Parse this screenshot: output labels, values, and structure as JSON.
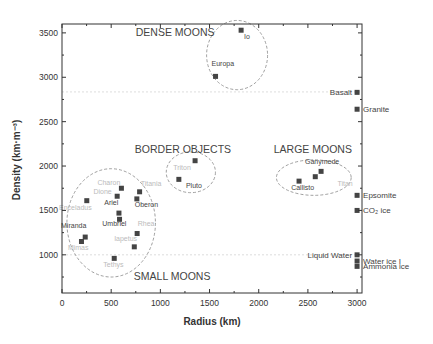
{
  "chart_data": {
    "type": "scatter",
    "title": "",
    "xlabel": "Radius (km)",
    "ylabel": "Density (km·m⁻³)",
    "xlim": [
      0,
      3050
    ],
    "ylim": [
      570,
      3600
    ],
    "xticks": [
      0,
      500,
      1000,
      1500,
      2000,
      2500,
      3000
    ],
    "yticks": [
      1000,
      1500,
      2000,
      2500,
      3000,
      3500
    ],
    "grid": false,
    "legend": null,
    "reference_lines": [
      2835,
      1000
    ],
    "groups": [
      {
        "name": "DENSE MOONS",
        "label_x": 1150,
        "label_y": 3470,
        "ellipse": {
          "cx": 1780,
          "cy": 3250,
          "rx": 310,
          "ry": 390
        }
      },
      {
        "name": "BORDER OBJECTS",
        "label_x": 1230,
        "label_y": 2150,
        "ellipse": {
          "cx": 1310,
          "cy": 1930,
          "rx": 250,
          "ry": 230
        }
      },
      {
        "name": "LARGE MOONS",
        "label_x": 2550,
        "label_y": 2150,
        "ellipse": {
          "cx": 2560,
          "cy": 1870,
          "rx": 380,
          "ry": 200
        }
      },
      {
        "name": "SMALL MOONS",
        "label_x": 1120,
        "label_y": 720,
        "ellipse": {
          "cx": 500,
          "cy": 1360,
          "rx": 450,
          "ry": 610
        }
      }
    ],
    "series": [
      {
        "name": "Moons",
        "points": [
          {
            "label": "Io",
            "x": 1821,
            "y": 3530,
            "faint": false,
            "lx": 1850,
            "ly": 3430
          },
          {
            "label": "Europa",
            "x": 1561,
            "y": 3010,
            "faint": false,
            "lx": 1520,
            "ly": 3130
          },
          {
            "label": "Triton",
            "x": 1353,
            "y": 2060,
            "faint": true,
            "lx": 1130,
            "ly": 1960
          },
          {
            "label": "Pluto",
            "x": 1188,
            "y": 1850,
            "faint": false,
            "lx": 1260,
            "ly": 1750
          },
          {
            "label": "Ganymede",
            "x": 2634,
            "y": 1940,
            "faint": false,
            "lx": 2470,
            "ly": 2020
          },
          {
            "label": "Titan",
            "x": 2575,
            "y": 1880,
            "faint": true,
            "lx": 2800,
            "ly": 1780
          },
          {
            "label": "Callisto",
            "x": 2410,
            "y": 1830,
            "faint": false,
            "lx": 2330,
            "ly": 1730
          },
          {
            "label": "Charon",
            "x": 604,
            "y": 1750,
            "faint": true,
            "lx": 360,
            "ly": 1790
          },
          {
            "label": "Titania",
            "x": 789,
            "y": 1710,
            "faint": true,
            "lx": 800,
            "ly": 1780
          },
          {
            "label": "Dione",
            "x": 561,
            "y": 1660,
            "faint": true,
            "lx": 320,
            "ly": 1690
          },
          {
            "label": "Oberon",
            "x": 761,
            "y": 1630,
            "faint": false,
            "lx": 740,
            "ly": 1540
          },
          {
            "label": "Enceladus",
            "x": 252,
            "y": 1610,
            "faint": true,
            "lx": -30,
            "ly": 1510
          },
          {
            "label": "Ariel",
            "x": 579,
            "y": 1470,
            "faint": false,
            "lx": 430,
            "ly": 1560
          },
          {
            "label": "Umbriel",
            "x": 585,
            "y": 1400,
            "faint": false,
            "lx": 410,
            "ly": 1330
          },
          {
            "label": "Rhea",
            "x": 764,
            "y": 1240,
            "faint": true,
            "lx": 770,
            "ly": 1330
          },
          {
            "label": "Miranda",
            "x": 236,
            "y": 1200,
            "faint": false,
            "lx": -10,
            "ly": 1300
          },
          {
            "label": "Mimas",
            "x": 198,
            "y": 1150,
            "faint": true,
            "lx": 60,
            "ly": 1050
          },
          {
            "label": "Iapetus",
            "x": 735,
            "y": 1090,
            "faint": true,
            "lx": 530,
            "ly": 1160
          },
          {
            "label": "Tethys",
            "x": 531,
            "y": 960,
            "faint": true,
            "lx": 420,
            "ly": 860
          }
        ]
      },
      {
        "name": "Reference materials",
        "points": [
          {
            "label": "Basalt",
            "x": 3000,
            "y": 2830,
            "side": "left"
          },
          {
            "label": "Granite",
            "x": 3000,
            "y": 2640,
            "side": "right"
          },
          {
            "label": "Epsomite",
            "x": 3000,
            "y": 1670,
            "side": "right"
          },
          {
            "label": "CO₂ ice",
            "x": 3000,
            "y": 1500,
            "side": "right"
          },
          {
            "label": "Liquid Water",
            "x": 3000,
            "y": 1000,
            "side": "left"
          },
          {
            "label": "Water ice I",
            "x": 3000,
            "y": 930,
            "side": "right"
          },
          {
            "label": "Ammonia ice",
            "x": 3000,
            "y": 870,
            "side": "right"
          }
        ]
      }
    ]
  },
  "colors": {
    "marker": "#444444",
    "axis": "#333333",
    "ellipse": "#888888",
    "refline": "#dddddd"
  }
}
